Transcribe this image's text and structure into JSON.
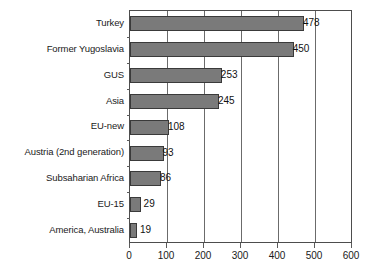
{
  "chart_data": {
    "type": "bar",
    "orientation": "horizontal",
    "title": "",
    "subtitle": "",
    "xlabel": "",
    "ylabel": "",
    "xlim": [
      0,
      600
    ],
    "xticks": [
      0,
      100,
      200,
      300,
      400,
      500,
      600
    ],
    "grid": true,
    "grid_axis": "x",
    "legend": false,
    "legend_position": "none",
    "data_labels": true,
    "categories": [
      "Turkey",
      "Former Yugoslavia",
      "GUS",
      "Asia",
      "EU-new",
      "Austria (2nd generation)",
      "Subsaharian Africa",
      "EU-15",
      "America, Australia"
    ],
    "values": [
      478,
      450,
      253,
      245,
      108,
      93,
      86,
      29,
      19
    ],
    "value_labels": [
      "478",
      "450",
      "253",
      "245",
      "108",
      "93",
      "86",
      "29",
      "19"
    ],
    "tick_labels": [
      "0",
      "100",
      "200",
      "300",
      "400",
      "500",
      "600"
    ],
    "colors": {
      "bar_fill": "#7a7a7a",
      "bar_stroke": "#3a3a3a",
      "gridline": "#6b6b6b",
      "axis": "#4d4d4d",
      "background": "#ffffff",
      "text": "#1a1a1a"
    }
  }
}
